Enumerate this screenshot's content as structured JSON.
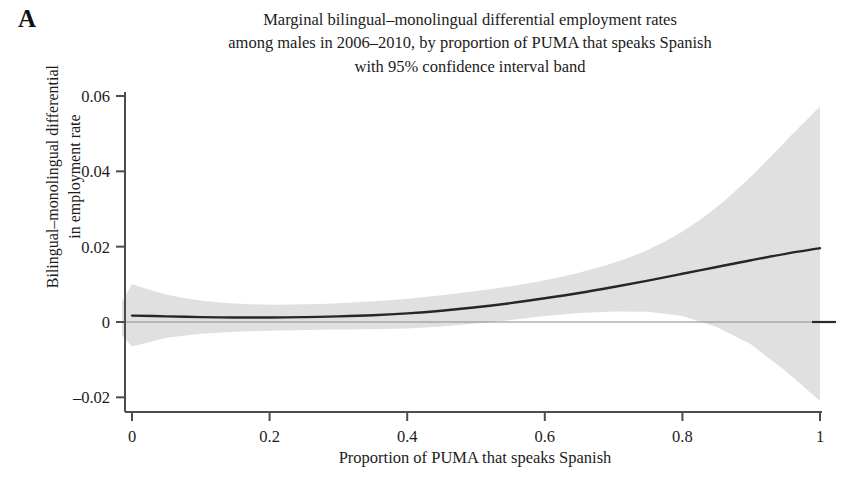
{
  "panel": {
    "label": "A"
  },
  "title": {
    "line1": "Marginal bilingual–monolingual differential employment rates",
    "line2": "among males in 2006–2010, by proportion of PUMA that speaks Spanish",
    "line3": "with 95% confidence interval band"
  },
  "axes": {
    "y_title_line1": "Bilingual–monolingual differential",
    "y_title_line2": "in employment rate",
    "x_title": "Proportion of PUMA that speaks Spanish",
    "x_tick_labels": [
      "0",
      "0.2",
      "0.4",
      "0.6",
      "0.8",
      "1"
    ],
    "y_tick_labels": [
      "0.06",
      "0.04",
      "0.02",
      "0",
      "–0.02"
    ]
  },
  "colors": {
    "line": "#262626",
    "band": "#e0e0e0",
    "axis": "#4d4d4d",
    "text": "#1c1c1c",
    "background": "#ffffff"
  },
  "chart_data": {
    "type": "line",
    "title": "Marginal bilingual–monolingual differential employment rates among males in 2006–2010, by proportion of PUMA that speaks Spanish with 95% confidence interval band",
    "xlabel": "Proportion of PUMA that speaks Spanish",
    "ylabel": "Bilingual–monolingual differential in employment rate",
    "xlim": [
      0,
      1
    ],
    "ylim": [
      -0.02,
      0.06
    ],
    "xticks": [
      0,
      0.2,
      0.4,
      0.6,
      0.8,
      1
    ],
    "yticks": [
      -0.02,
      0,
      0.02,
      0.04,
      0.06
    ],
    "grid": false,
    "legend": null,
    "zero_reference_line": 0,
    "x": [
      0.0,
      0.05,
      0.1,
      0.15,
      0.2,
      0.25,
      0.3,
      0.35,
      0.4,
      0.45,
      0.5,
      0.55,
      0.6,
      0.65,
      0.7,
      0.75,
      0.8,
      0.85,
      0.9,
      0.95,
      1.0
    ],
    "series": [
      {
        "name": "Marginal differential (point estimate)",
        "values": [
          0.0017,
          0.0015,
          0.0013,
          0.0012,
          0.0012,
          0.0013,
          0.0015,
          0.0018,
          0.0023,
          0.003,
          0.0039,
          0.005,
          0.0063,
          0.0077,
          0.0093,
          0.011,
          0.0128,
          0.0146,
          0.0164,
          0.0181,
          0.0196
        ]
      },
      {
        "name": "95% CI upper",
        "values": [
          0.01,
          0.0073,
          0.0057,
          0.0049,
          0.0046,
          0.0047,
          0.005,
          0.0055,
          0.0062,
          0.0071,
          0.0082,
          0.0095,
          0.0111,
          0.0131,
          0.0157,
          0.0192,
          0.024,
          0.0305,
          0.0387,
          0.048,
          0.0572
        ]
      },
      {
        "name": "95% CI lower",
        "values": [
          -0.0065,
          -0.0042,
          -0.0031,
          -0.0026,
          -0.0023,
          -0.0021,
          -0.002,
          -0.0019,
          -0.0017,
          -0.0012,
          -0.0004,
          0.0005,
          0.0016,
          0.0024,
          0.0028,
          0.0027,
          0.0016,
          -0.0013,
          -0.006,
          -0.013,
          -0.021
        ]
      }
    ]
  }
}
